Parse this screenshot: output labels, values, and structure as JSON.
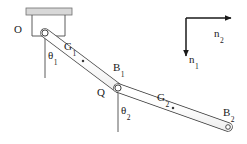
{
  "figure": {
    "type": "mechanics-diagram",
    "background_color": "#ffffff",
    "line_color": "#3a3a3a",
    "label_color": "#1a1a1a",
    "ceiling_fill": "#d8d8d8"
  },
  "labels": {
    "origin": {
      "text": "O",
      "sub": ""
    },
    "com1": {
      "text": "G",
      "sub": "1"
    },
    "com2": {
      "text": "G",
      "sub": "2"
    },
    "joint_end1": {
      "text": "B",
      "sub": "1"
    },
    "joint": {
      "text": "Q",
      "sub": ""
    },
    "end2": {
      "text": "B",
      "sub": "2"
    },
    "angle1": {
      "text": "θ",
      "sub": "1"
    },
    "angle2": {
      "text": "θ",
      "sub": "2"
    },
    "axis_horizontal": {
      "text": "n",
      "sub": "2"
    },
    "axis_vertical": {
      "text": "n",
      "sub": "1"
    }
  },
  "geometry": {
    "ceiling": {
      "x": 26,
      "y": 8,
      "width": 46,
      "height": 7
    },
    "bracket": {
      "left": 32,
      "right": 65,
      "top": 15,
      "bottom": 36
    },
    "pivot_o": {
      "x": 45,
      "y": 33,
      "r": 3.1
    },
    "joint_q": {
      "x": 118,
      "y": 88,
      "r": 3.1
    },
    "end_b2": {
      "x": 228,
      "y": 127,
      "r": 2.6
    },
    "link1": {
      "x1": 45,
      "y1": 33,
      "x2": 118,
      "y2": 88,
      "half_width": 4.2
    },
    "link2": {
      "x1": 118,
      "y1": 88,
      "x2": 228,
      "y2": 127,
      "half_width": 4.2
    },
    "com1_dot": {
      "x": 83,
      "y": 61
    },
    "com2_dot": {
      "x": 173,
      "y": 108
    },
    "ref_line1": {
      "x": 45,
      "y1": 36,
      "y2": 78
    },
    "ref_line2": {
      "x": 118,
      "y1": 91,
      "y2": 132
    },
    "axis_origin": {
      "x": 186,
      "y": 18
    },
    "axis_h_end": {
      "x": 238,
      "y": 18
    },
    "axis_v_end": {
      "x": 186,
      "y": 62
    }
  },
  "label_positions": {
    "origin": {
      "x": 14,
      "y": 24
    },
    "com1": {
      "x": 64,
      "y": 41
    },
    "com2": {
      "x": 157,
      "y": 92
    },
    "joint_end1": {
      "x": 113,
      "y": 62
    },
    "joint": {
      "x": 97,
      "y": 87
    },
    "end2": {
      "x": 223,
      "y": 107
    },
    "angle1": {
      "x": 48,
      "y": 50
    },
    "angle2": {
      "x": 121,
      "y": 105
    },
    "axis_horizontal": {
      "x": 214,
      "y": 28
    },
    "axis_vertical": {
      "x": 189,
      "y": 54
    }
  }
}
